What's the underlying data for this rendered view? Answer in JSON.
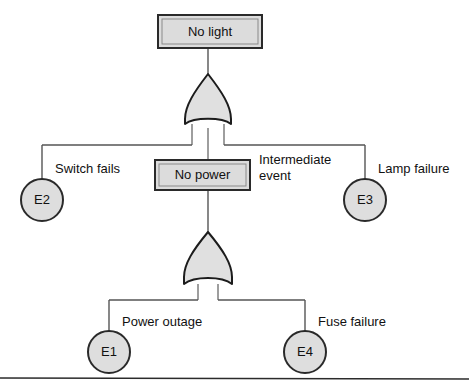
{
  "diagram": {
    "type": "fault-tree",
    "background_color": "#ffffff",
    "box_fill": "#dcdcdc",
    "gate_fill": "#e0e0e0",
    "circle_fill": "#dedede",
    "stroke_color": "#2a2a2a",
    "line_color": "#555555"
  },
  "nodes": {
    "top_event": {
      "label": "No light",
      "shape": "rectangle",
      "x": 210,
      "y": 31,
      "width": 104,
      "height": 33
    },
    "intermediate_event": {
      "label": "No power",
      "shape": "rectangle",
      "x": 202,
      "y": 175,
      "width": 95,
      "height": 30
    }
  },
  "gates": [
    {
      "name": "top-gate",
      "kind": "or-gate",
      "parent": "No light",
      "x": 208,
      "y": 101,
      "input_count": 3
    },
    {
      "name": "bottom-gate",
      "kind": "or-gate",
      "parent": "No power",
      "x": 208,
      "y": 260,
      "input_count": 2
    }
  ],
  "basic_events": [
    {
      "id": "E2",
      "label": "Switch fails",
      "x": 42,
      "y": 200,
      "r": 21,
      "label_x": 55,
      "label_y": 170
    },
    {
      "id": "E3",
      "label": "Lamp failure",
      "x": 365,
      "y": 200,
      "r": 21,
      "label_x": 378,
      "label_y": 170
    },
    {
      "id": "E1",
      "label": "Power outage",
      "x": 109,
      "y": 352,
      "r": 21,
      "label_x": 122,
      "label_y": 323
    },
    {
      "id": "E4",
      "label": "Fuse failure",
      "x": 305,
      "y": 352,
      "r": 21,
      "label_x": 318,
      "label_y": 323
    }
  ],
  "annotations": [
    {
      "name": "intermediate-event-annotation",
      "line1": "Intermediate",
      "line2": "event",
      "x": 259,
      "y": 161
    }
  ],
  "connector_geometry": {
    "top_bus_y": 145,
    "top_bus_left_x": 42,
    "top_bus_right_x": 365,
    "bottom_bus_y": 300,
    "bottom_bus_left_x": 109,
    "bottom_bus_right_x": 305,
    "center_x": 208,
    "footer_rule_y": 378
  }
}
